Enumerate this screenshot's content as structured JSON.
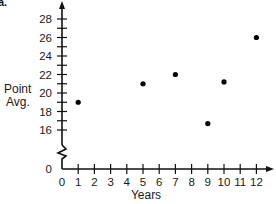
{
  "corner_label": "a.",
  "chart_data": {
    "type": "scatter",
    "title": "",
    "xlabel": "Years",
    "ylabel": "Point Avg.",
    "ylabel_lines": [
      "Point",
      "Avg."
    ],
    "x_ticks": [
      0,
      1,
      2,
      3,
      4,
      5,
      6,
      7,
      8,
      9,
      10,
      11,
      12
    ],
    "y_ticks": [
      0,
      16,
      18,
      20,
      22,
      24,
      26,
      28
    ],
    "y_axis_break": true,
    "xlim": [
      0,
      12.5
    ],
    "ylim": [
      15,
      29
    ],
    "grid": false,
    "legend": null,
    "points": [
      {
        "x": 1,
        "y": 19
      },
      {
        "x": 5,
        "y": 21
      },
      {
        "x": 7,
        "y": 22
      },
      {
        "x": 9,
        "y": 16.7
      },
      {
        "x": 10,
        "y": 21.2
      },
      {
        "x": 12,
        "y": 26
      }
    ],
    "marker_color": "#000000"
  }
}
